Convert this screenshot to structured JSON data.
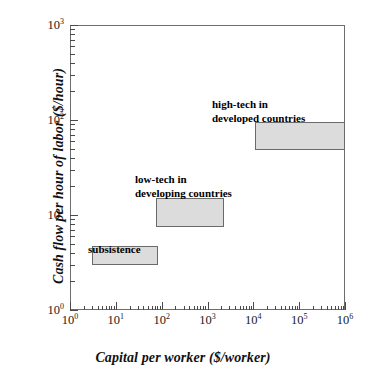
{
  "chart_data": {
    "type": "scatter",
    "title": "",
    "xlabel": "Capital per worker ($/worker)",
    "ylabel": "Cash flow per hour of labor ($/hour)",
    "xscale": "log",
    "yscale": "log",
    "xlim": [
      1,
      1000000
    ],
    "ylim": [
      1,
      1000
    ],
    "grid": false,
    "legend": "none",
    "xticks": [
      {
        "value": 1,
        "label": "10",
        "exponent": "0"
      },
      {
        "value": 10,
        "label": "10",
        "exponent": "1"
      },
      {
        "value": 100,
        "label": "10",
        "exponent": "2"
      },
      {
        "value": 1000,
        "label": "10",
        "exponent": "3"
      },
      {
        "value": 10000,
        "label": "10",
        "exponent": "4"
      },
      {
        "value": 100000,
        "label": "10",
        "exponent": "5"
      },
      {
        "value": 1000000,
        "label": "10",
        "exponent": "6"
      }
    ],
    "yticks": [
      {
        "value": 1,
        "label": "10",
        "exponent": "0"
      },
      {
        "value": 10,
        "label": "10",
        "exponent": "1"
      },
      {
        "value": 100,
        "label": "10",
        "exponent": "2"
      },
      {
        "value": 1000,
        "label": "10",
        "exponent": "3"
      }
    ],
    "boxes": [
      {
        "name": "subsistence",
        "label": "subsistence",
        "label_lines": [
          "subsistence"
        ],
        "x_range": [
          3.0,
          85.0
        ],
        "y_range": [
          3.0,
          4.7
        ],
        "fill": "#dcdcdc",
        "stroke": "#6a6a6a"
      },
      {
        "name": "low-tech-developing",
        "label": "low-tech in developing countries",
        "label_lines": [
          "low-tech in",
          "developing countries"
        ],
        "x_range": [
          75.0,
          2300.0
        ],
        "y_range": [
          7.5,
          15.0
        ],
        "fill": "#dcdcdc",
        "stroke": "#6a6a6a"
      },
      {
        "name": "high-tech-developed",
        "label": "high-tech in developed countries",
        "label_lines": [
          "high-tech in",
          "developed countries"
        ],
        "x_range": [
          11000.0,
          1000000.0
        ],
        "y_range": [
          48.0,
          95.0
        ],
        "fill": "#dcdcdc",
        "stroke": "#6a6a6a"
      }
    ],
    "annotations": [
      {
        "name": "subsistence-label",
        "lines": [
          "subsistence"
        ]
      },
      {
        "name": "low-tech-label",
        "lines": [
          "low-tech in",
          "developing countries"
        ]
      },
      {
        "name": "high-tech-label",
        "lines": [
          "high-tech in",
          "developed countries"
        ]
      }
    ]
  },
  "axes": {
    "x_title": "Capital per worker ($/worker)",
    "y_title": "Cash flow per hour of labor ($/hour)"
  },
  "colors": {
    "box_fill": "#dcdcdc",
    "box_stroke": "#6a6a6a",
    "frame": "#6d6d6d",
    "text": "#000000",
    "background": "#ffffff"
  }
}
